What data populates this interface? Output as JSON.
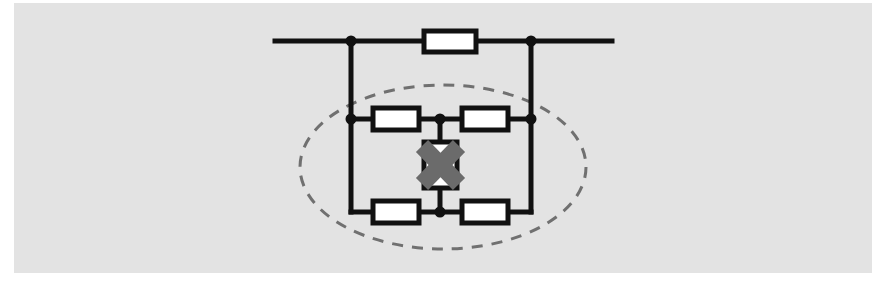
{
  "figure": {
    "canvas": {
      "width": 887,
      "height": 291
    },
    "background_color": "#ffffff",
    "panel_color": "#e3e3e3",
    "panel": {
      "x": 14,
      "y": 3,
      "width": 858,
      "height": 270
    },
    "line_color": "#111111",
    "component_fill": "#ffffff",
    "cross_out_color": "#6b6b6b",
    "dashed_outline_color": "#707070"
  },
  "chart_data": {
    "type": "diagram",
    "diagram_kind": "electrical-schematic",
    "nodes": [
      {
        "id": "left-terminal",
        "label": "left terminal",
        "x": 275,
        "y": 41
      },
      {
        "id": "node-a",
        "label": "node A",
        "x": 351,
        "y": 41
      },
      {
        "id": "node-b",
        "label": "node B",
        "x": 531,
        "y": 41
      },
      {
        "id": "right-terminal",
        "label": "right terminal",
        "x": 612,
        "y": 41
      },
      {
        "id": "node-c",
        "label": "node C",
        "x": 351,
        "y": 119
      },
      {
        "id": "node-d",
        "label": "node D",
        "x": 531,
        "y": 119
      },
      {
        "id": "node-top-mid",
        "label": "bridge top mid",
        "x": 440,
        "y": 119
      },
      {
        "id": "node-bot-mid",
        "label": "bridge bottom mid",
        "x": 440,
        "y": 212
      },
      {
        "id": "node-e",
        "label": "node E",
        "x": 351,
        "y": 212
      },
      {
        "id": "node-f",
        "label": "node F",
        "x": 531,
        "y": 212
      }
    ],
    "components": [
      {
        "id": "r-bypass",
        "type": "resistor",
        "label": "bypass resistor",
        "x": 424,
        "y": 31,
        "width": 52,
        "height": 21,
        "orientation": "horizontal",
        "between": [
          "node-a",
          "node-b"
        ]
      },
      {
        "id": "r-top-left",
        "type": "resistor",
        "label": "bridge arm top left",
        "x": 373,
        "y": 108,
        "width": 46,
        "height": 22,
        "orientation": "horizontal",
        "between": [
          "node-c",
          "node-top-mid"
        ]
      },
      {
        "id": "r-top-right",
        "type": "resistor",
        "label": "bridge arm top right",
        "x": 462,
        "y": 108,
        "width": 46,
        "height": 22,
        "orientation": "horizontal",
        "between": [
          "node-top-mid",
          "node-d"
        ]
      },
      {
        "id": "r-bot-left",
        "type": "resistor",
        "label": "bridge arm bottom left",
        "x": 373,
        "y": 201,
        "width": 46,
        "height": 22,
        "orientation": "horizontal",
        "between": [
          "node-e",
          "node-bot-mid"
        ]
      },
      {
        "id": "r-bot-right",
        "type": "resistor",
        "label": "bridge arm bottom right",
        "x": 462,
        "y": 201,
        "width": 46,
        "height": 22,
        "orientation": "horizontal",
        "between": [
          "node-bot-mid",
          "node-f"
        ]
      },
      {
        "id": "diode-pair",
        "type": "antiparallel-diode-pair",
        "label": "back-to-back diode pair (crossed out)",
        "x": 424,
        "y": 142,
        "width": 33,
        "height": 46,
        "orientation": "vertical",
        "between": [
          "node-top-mid",
          "node-bot-mid"
        ],
        "crossed_out": true
      }
    ],
    "wires": [
      {
        "id": "w-left-lead",
        "from": [
          275,
          41
        ],
        "to": [
          351,
          41
        ]
      },
      {
        "id": "w-a-to-r",
        "from": [
          351,
          41
        ],
        "to": [
          424,
          41
        ]
      },
      {
        "id": "w-r-to-b",
        "from": [
          476,
          41
        ],
        "to": [
          531,
          41
        ]
      },
      {
        "id": "w-right-lead",
        "from": [
          531,
          41
        ],
        "to": [
          612,
          41
        ]
      },
      {
        "id": "w-a-down",
        "from": [
          351,
          41
        ],
        "to": [
          351,
          212
        ]
      },
      {
        "id": "w-b-down",
        "from": [
          531,
          41
        ],
        "to": [
          531,
          212
        ]
      },
      {
        "id": "w-c-to-rtl",
        "from": [
          351,
          119
        ],
        "to": [
          373,
          119
        ]
      },
      {
        "id": "w-rtl-to-mid",
        "from": [
          419,
          119
        ],
        "to": [
          440,
          119
        ]
      },
      {
        "id": "w-mid-to-rtr",
        "from": [
          440,
          119
        ],
        "to": [
          462,
          119
        ]
      },
      {
        "id": "w-rtr-to-d",
        "from": [
          508,
          119
        ],
        "to": [
          531,
          119
        ]
      },
      {
        "id": "w-e-to-rbl",
        "from": [
          351,
          212
        ],
        "to": [
          373,
          212
        ]
      },
      {
        "id": "w-rbl-to-mid",
        "from": [
          419,
          212
        ],
        "to": [
          440,
          212
        ]
      },
      {
        "id": "w-mid-to-rbr",
        "from": [
          440,
          212
        ],
        "to": [
          462,
          212
        ]
      },
      {
        "id": "w-rbr-to-f",
        "from": [
          508,
          212
        ],
        "to": [
          531,
          212
        ]
      },
      {
        "id": "w-mid-top-stub",
        "from": [
          440,
          119
        ],
        "to": [
          440,
          142
        ]
      },
      {
        "id": "w-mid-bot-stub",
        "from": [
          440,
          188
        ],
        "to": [
          440,
          212
        ]
      }
    ],
    "junction_dots": [
      {
        "id": "dot-node-a",
        "x": 351,
        "y": 41,
        "r": 5
      },
      {
        "id": "dot-node-b",
        "x": 531,
        "y": 41,
        "r": 5
      },
      {
        "id": "dot-node-c",
        "x": 351,
        "y": 119,
        "r": 5
      },
      {
        "id": "dot-node-d",
        "x": 531,
        "y": 119,
        "r": 5
      },
      {
        "id": "dot-node-top-mid",
        "x": 440,
        "y": 119,
        "r": 5
      },
      {
        "id": "dot-node-bot-mid",
        "x": 440,
        "y": 212,
        "r": 5
      }
    ],
    "annotations": [
      {
        "id": "bridge-highlight",
        "type": "dashed-ellipse",
        "label": "dashed ellipse enclosing the bridge sub-circuit",
        "cx": 443,
        "cy": 167,
        "rx": 143,
        "ry": 82,
        "dash": "11 9",
        "stroke_width": 3
      }
    ]
  }
}
